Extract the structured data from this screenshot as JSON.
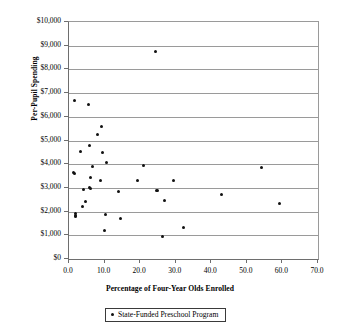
{
  "chart_data": {
    "type": "scatter",
    "title": "",
    "xlabel": "Percentage of Four-Year Olds Enrolled",
    "ylabel": "Per-Pupil Spending",
    "xlim": [
      0,
      70
    ],
    "ylim": [
      0,
      10000
    ],
    "xticks": [
      0,
      10,
      20,
      30,
      40,
      50,
      60,
      70
    ],
    "xtick_labels": [
      "0.0",
      "10.0",
      "20.0",
      "30.0",
      "40.0",
      "50.0",
      "60.0",
      "70.0"
    ],
    "yticks": [
      0,
      1000,
      2000,
      3000,
      4000,
      5000,
      6000,
      7000,
      8000,
      9000,
      10000
    ],
    "ytick_labels": [
      "$0",
      "$1,000",
      "$2,000",
      "$3,000",
      "$4,000",
      "$5,000",
      "$6,000",
      "$7,000",
      "$8,000",
      "$9,000",
      "$10,000"
    ],
    "grid": "horizontal",
    "legend_position": "below-axes",
    "marker_color": "#111111",
    "grid_color": "#9a9a9a",
    "axis_color": "#6e6e6e",
    "series": [
      {
        "name": "State-Funded Preschool Program",
        "points": [
          [
            1.6,
            6700
          ],
          [
            5.4,
            6540
          ],
          [
            24.3,
            8750
          ],
          [
            9.0,
            5600
          ],
          [
            8.1,
            5270
          ],
          [
            5.9,
            4790
          ],
          [
            3.3,
            4540
          ],
          [
            9.5,
            4500
          ],
          [
            10.5,
            4090
          ],
          [
            6.7,
            3900
          ],
          [
            21.0,
            3930
          ],
          [
            54.2,
            3840
          ],
          [
            1.2,
            3650
          ],
          [
            1.5,
            3620
          ],
          [
            19.3,
            3300
          ],
          [
            29.4,
            3330
          ],
          [
            6.1,
            3430
          ],
          [
            8.9,
            3300
          ],
          [
            5.9,
            3020
          ],
          [
            6.1,
            2990
          ],
          [
            4.1,
            2940
          ],
          [
            24.5,
            2900
          ],
          [
            25.0,
            2870
          ],
          [
            13.9,
            2850
          ],
          [
            42.9,
            2730
          ],
          [
            26.8,
            2470
          ],
          [
            59.3,
            2350
          ],
          [
            4.5,
            2410
          ],
          [
            3.8,
            2210
          ],
          [
            1.9,
            1900
          ],
          [
            1.9,
            1840
          ],
          [
            1.9,
            1780
          ],
          [
            10.3,
            1870
          ],
          [
            14.6,
            1710
          ],
          [
            32.3,
            1310
          ],
          [
            10.0,
            1200
          ],
          [
            26.4,
            930
          ]
        ]
      }
    ]
  },
  "legend": {
    "entries": [
      {
        "label": "State-Funded Preschool Program",
        "marker": "dot-marker"
      }
    ]
  }
}
